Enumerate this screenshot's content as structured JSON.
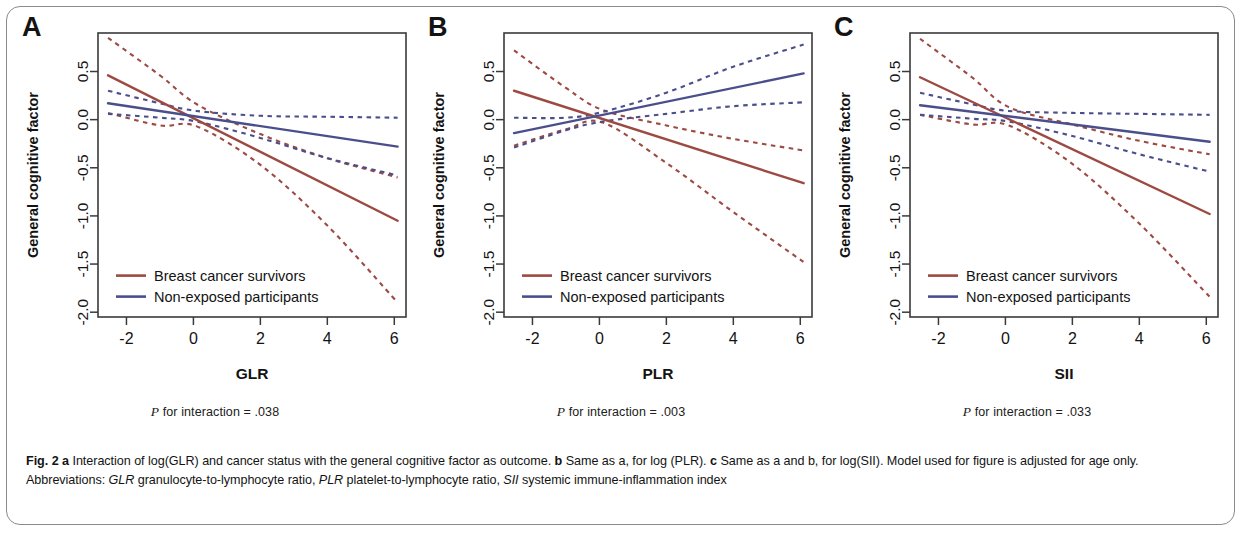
{
  "figure": {
    "label": "Fig. 2",
    "caption_parts": [
      {
        "text": "Fig. 2 ",
        "style": "bold"
      },
      {
        "text": "a",
        "style": "bold"
      },
      {
        "text": " Interaction of log(GLR) and cancer status with the general cognitive factor as outcome. ",
        "style": "normal"
      },
      {
        "text": "b",
        "style": "bold"
      },
      {
        "text": " Same as a, for log (PLR). ",
        "style": "normal"
      },
      {
        "text": "c",
        "style": "bold"
      },
      {
        "text": " Same as a and b, for log(SII). Model used for figure is adjusted for age only. Abbreviations: ",
        "style": "normal"
      },
      {
        "text": "GLR",
        "style": "italic"
      },
      {
        "text": " granulocyte-to-lymphocyte ratio, ",
        "style": "normal"
      },
      {
        "text": "PLR",
        "style": "italic"
      },
      {
        "text": " platelet-to-lymphocyte ratio, ",
        "style": "normal"
      },
      {
        "text": "SII",
        "style": "italic"
      },
      {
        "text": " systemic immune-inflammation index",
        "style": "normal"
      }
    ],
    "caption_plain": "Fig. 2 a Interaction of log(GLR) and cancer status with the general cognitive factor as outcome. b Same as a, for log (PLR). c Same as a and b, for log(SII). Model used for figure is adjusted for age only. Abbreviations: GLR granulocyte-to-lymphocyte ratio, PLR platelet-to-lymphocyte ratio, SII systemic immune-inflammation index"
  },
  "colors": {
    "survivors": "#9c4a42",
    "non_exposed": "#4a4f8c",
    "axis": "#3a3a3a",
    "text": "#131313"
  },
  "legend": {
    "survivors_label": "Breast cancer survivors",
    "non_exposed_label": "Non-exposed participants"
  },
  "panels": [
    {
      "letter": "A",
      "pvalue_text": "P for interaction = .038",
      "pvalue_prefix": "P",
      "pvalue_rest": " for interaction = .038"
    },
    {
      "letter": "B",
      "pvalue_text": "P for interaction = .003",
      "pvalue_prefix": "P",
      "pvalue_rest": " for interaction = .003"
    },
    {
      "letter": "C",
      "pvalue_text": "P for interaction = .033",
      "pvalue_prefix": "P",
      "pvalue_rest": " for interaction = .033"
    }
  ],
  "chart_data": [
    {
      "type": "line",
      "panel": "A",
      "title": "",
      "xlabel": "GLR",
      "ylabel": "General cognitive factor",
      "xlim": [
        -2.85,
        6.35
      ],
      "ylim": [
        -2.05,
        0.9
      ],
      "xticks": [
        -2,
        0,
        2,
        4,
        6
      ],
      "xticklabels": [
        "-2",
        "0",
        "2",
        "4",
        "6"
      ],
      "yticks": [
        0.5,
        0.0,
        -0.5,
        -1.0,
        -1.5,
        -2.0
      ],
      "yticklabels": [
        "0.5",
        "0.0",
        "-0.5",
        "-1.0",
        "-1.5",
        "-2.0"
      ],
      "grid": false,
      "legend_position": "bottom-left",
      "series": [
        {
          "name": "Breast cancer survivors",
          "color": "#9c4a42",
          "style": "solid",
          "x": [
            -2.55,
            6.1
          ],
          "y": [
            0.46,
            -1.05
          ],
          "slope": -0.1746,
          "intercept": 0.0147,
          "ci_upper": {
            "x": [
              -2.55,
              -1.0,
              0.1,
              2.0,
              4.0,
              6.1
            ],
            "y": [
              0.85,
              0.46,
              0.16,
              -0.15,
              -0.4,
              -0.6
            ]
          },
          "ci_lower": {
            "x": [
              -2.55,
              -1.0,
              0.1,
              2.0,
              4.0,
              6.1
            ],
            "y": [
              0.07,
              -0.06,
              -0.07,
              -0.47,
              -1.1,
              -1.9
            ]
          }
        },
        {
          "name": "Non-exposed participants",
          "color": "#4a4f8c",
          "style": "solid",
          "x": [
            -2.55,
            6.1
          ],
          "y": [
            0.17,
            -0.28
          ],
          "slope": -0.052,
          "intercept": 0.0374,
          "ci_upper": {
            "x": [
              -2.55,
              -1.0,
              0.1,
              2.0,
              4.0,
              6.1
            ],
            "y": [
              0.3,
              0.17,
              0.09,
              0.04,
              0.03,
              0.02
            ]
          },
          "ci_lower": {
            "x": [
              -2.55,
              -1.0,
              0.1,
              2.0,
              4.0,
              6.1
            ],
            "y": [
              0.06,
              0.02,
              -0.02,
              -0.19,
              -0.4,
              -0.58
            ]
          }
        }
      ]
    },
    {
      "type": "line",
      "panel": "B",
      "title": "",
      "xlabel": "PLR",
      "ylabel": "General cognitive factor",
      "xlim": [
        -2.85,
        6.35
      ],
      "ylim": [
        -2.05,
        0.9
      ],
      "xticks": [
        -2,
        0,
        2,
        4,
        6
      ],
      "xticklabels": [
        "-2",
        "0",
        "2",
        "4",
        "6"
      ],
      "yticks": [
        0.5,
        0.0,
        -0.5,
        -1.0,
        -1.5,
        -2.0
      ],
      "yticklabels": [
        "0.5",
        "0.0",
        "-0.5",
        "-1.0",
        "-1.5",
        "-2.0"
      ],
      "grid": false,
      "legend_position": "bottom-left",
      "series": [
        {
          "name": "Breast cancer survivors",
          "color": "#9c4a42",
          "style": "solid",
          "x": [
            -2.55,
            6.1
          ],
          "y": [
            0.3,
            -0.66
          ],
          "slope": -0.111,
          "intercept": 0.0169,
          "ci_upper": {
            "x": [
              -2.55,
              -1.0,
              0.1,
              2.0,
              4.0,
              6.1
            ],
            "y": [
              0.72,
              0.33,
              0.1,
              -0.06,
              -0.2,
              -0.32
            ]
          },
          "ci_lower": {
            "x": [
              -2.55,
              -1.0,
              0.1,
              2.0,
              4.0,
              6.1
            ],
            "y": [
              -0.27,
              -0.1,
              -0.03,
              -0.45,
              -0.96,
              -1.48
            ]
          }
        },
        {
          "name": "Non-exposed participants",
          "color": "#4a4f8c",
          "style": "solid",
          "x": [
            -2.55,
            6.1
          ],
          "y": [
            -0.14,
            0.48
          ],
          "slope": 0.0717,
          "intercept": 0.0429,
          "ci_upper": {
            "x": [
              -2.55,
              -1.0,
              0.1,
              2.0,
              4.0,
              6.1
            ],
            "y": [
              0.02,
              0.02,
              0.08,
              0.28,
              0.55,
              0.78
            ]
          },
          "ci_lower": {
            "x": [
              -2.55,
              -1.0,
              0.1,
              2.0,
              4.0,
              6.1
            ],
            "y": [
              -0.29,
              -0.11,
              -0.02,
              0.06,
              0.14,
              0.18
            ]
          }
        }
      ]
    },
    {
      "type": "line",
      "panel": "C",
      "title": "",
      "xlabel": "SII",
      "ylabel": "General cognitive factor",
      "xlim": [
        -2.85,
        6.35
      ],
      "ylim": [
        -2.05,
        0.9
      ],
      "xticks": [
        -2,
        0,
        2,
        4,
        6
      ],
      "xticklabels": [
        "-2",
        "0",
        "2",
        "4",
        "6"
      ],
      "yticks": [
        0.5,
        0.0,
        -0.5,
        -1.0,
        -1.5,
        -2.0
      ],
      "yticklabels": [
        "0.5",
        "0.0",
        "-0.5",
        "-1.0",
        "-1.5",
        "-2.0"
      ],
      "grid": false,
      "legend_position": "bottom-left",
      "series": [
        {
          "name": "Breast cancer survivors",
          "color": "#9c4a42",
          "style": "solid",
          "x": [
            -2.55,
            6.1
          ],
          "y": [
            0.44,
            -0.98
          ],
          "slope": -0.1642,
          "intercept": 0.0213,
          "ci_upper": {
            "x": [
              -2.55,
              -1.0,
              0.1,
              2.0,
              4.0,
              6.1
            ],
            "y": [
              0.84,
              0.44,
              0.13,
              -0.05,
              -0.22,
              -0.36
            ]
          },
          "ci_lower": {
            "x": [
              -2.55,
              -1.0,
              0.1,
              2.0,
              4.0,
              6.1
            ],
            "y": [
              0.05,
              -0.05,
              -0.06,
              -0.46,
              -1.08,
              -1.84
            ]
          }
        },
        {
          "name": "Non-exposed participants",
          "color": "#4a4f8c",
          "style": "solid",
          "x": [
            -2.55,
            6.1
          ],
          "y": [
            0.15,
            -0.23
          ],
          "slope": -0.0439,
          "intercept": 0.0381,
          "ci_upper": {
            "x": [
              -2.55,
              -1.0,
              0.1,
              2.0,
              4.0,
              6.1
            ],
            "y": [
              0.28,
              0.16,
              0.09,
              0.07,
              0.06,
              0.05
            ]
          },
          "ci_lower": {
            "x": [
              -2.55,
              -1.0,
              0.1,
              2.0,
              4.0,
              6.1
            ],
            "y": [
              0.05,
              0.01,
              -0.02,
              -0.17,
              -0.36,
              -0.54
            ]
          }
        }
      ]
    }
  ]
}
